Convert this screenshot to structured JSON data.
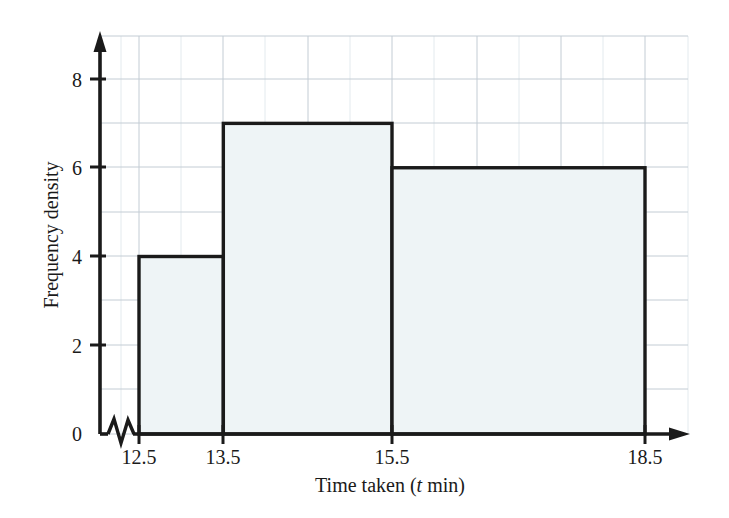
{
  "chart_data": {
    "type": "bar",
    "chart_subtype": "histogram",
    "title": "",
    "xlabel": "Time taken (t min)",
    "xlabel_parts": {
      "before": "Time taken (",
      "variable": "t",
      "after": " min)"
    },
    "ylabel": "Frequency density",
    "xlim": [
      12.5,
      18.5
    ],
    "ylim": [
      0,
      8.9
    ],
    "x_axis_broken": true,
    "x_break_symbol": "zigzag",
    "grid": true,
    "grid_spacing_x": 0.5,
    "grid_spacing_y": 1,
    "legend": "none",
    "x_tick_labels": [
      "12.5",
      "13.5",
      "15.5",
      "18.5"
    ],
    "x_tick_values": [
      12.5,
      13.5,
      15.5,
      18.5
    ],
    "y_tick_labels": [
      "0",
      "2",
      "4",
      "6",
      "8"
    ],
    "y_tick_values": [
      0,
      2,
      4,
      6,
      8
    ],
    "origin_label": "0",
    "bins": [
      {
        "label": "12.5 - 13.5",
        "x_start": 12.5,
        "x_end": 13.5,
        "width": 1,
        "frequency_density": 4,
        "frequency": 4
      },
      {
        "label": "13.5 - 15.5",
        "x_start": 13.5,
        "x_end": 15.5,
        "width": 2,
        "frequency_density": 7,
        "frequency": 14
      },
      {
        "label": "15.5 - 18.5",
        "x_start": 15.5,
        "x_end": 18.5,
        "width": 3,
        "frequency_density": 6,
        "frequency": 18
      }
    ],
    "colors": {
      "bar_fill": "#eef4f6",
      "bar_stroke": "#1a1a1a",
      "axis": "#1a1a1a",
      "grid_major": "#b9c4cc",
      "grid_minor": "#dfe6ea",
      "background": "#ffffff"
    }
  }
}
